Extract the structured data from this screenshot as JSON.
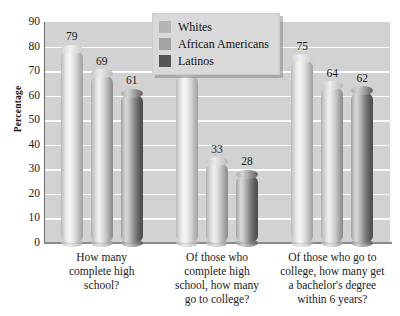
{
  "chart_data": {
    "type": "bar",
    "title": "",
    "xlabel": "",
    "ylabel": "Percentage",
    "ylim": [
      0,
      90
    ],
    "ytick_step": 10,
    "yticks": [
      90,
      80,
      70,
      60,
      50,
      40,
      30,
      20,
      10,
      0
    ],
    "grid": true,
    "legend_position": "top-center",
    "categories": [
      "How many complete high school?",
      "Of those who complete high school, how many go to college?",
      "Of those who go to college, how many get a bachelor's degree within 6 years?"
    ],
    "category_lines": [
      [
        "How many",
        "complete high",
        "school?"
      ],
      [
        "Of those who",
        "complete high",
        "school, how many",
        "go to college?"
      ],
      [
        "Of those who go to",
        "college, how many get",
        "a bachelor's degree",
        "within 6 years?"
      ]
    ],
    "series": [
      {
        "name": "Whites",
        "values": [
          79,
          69,
          75
        ],
        "color": "#b5b5b5"
      },
      {
        "name": "African Americans",
        "values": [
          69,
          33,
          64
        ],
        "color": "#a6a6a6"
      },
      {
        "name": "Latinos",
        "values": [
          61,
          28,
          62
        ],
        "color": "#5a5a5a"
      }
    ]
  },
  "legend": {
    "items": [
      {
        "label": "Whites",
        "swatch": "#b5b5b5"
      },
      {
        "label": "African Americans",
        "swatch": "#a3a3a3"
      },
      {
        "label": "Latinos",
        "swatch": "#555555"
      }
    ]
  },
  "axis": {
    "y_title": "Percentage"
  },
  "colors": {
    "plot_background": "#d2d2d2",
    "gridline": "#fbfbfb",
    "axis_line": "#6e6e6e",
    "text": "#1a1a1a",
    "legend_background": "#d9d9d9"
  }
}
